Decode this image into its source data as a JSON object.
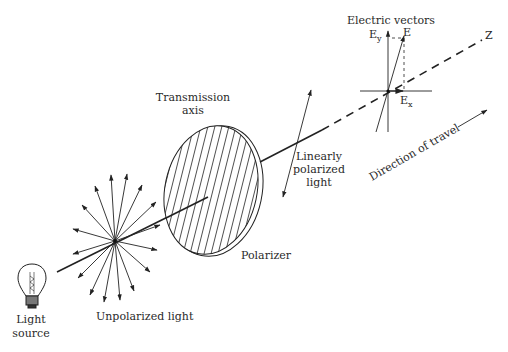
{
  "diagram": {
    "labels": {
      "light_source_line1": "Light",
      "light_source_line2": "source",
      "unpolarized_light": "Unpolarized light",
      "transmission_axis_line1": "Transmission",
      "transmission_axis_line2": "axis",
      "polarizer": "Polarizer",
      "linearly_polarized_line1": "Linearly",
      "linearly_polarized_line2": "polarized",
      "linearly_polarized_line3": "light",
      "direction_of_travel": "Direction of travel",
      "electric_vectors": "Electric vectors",
      "e_y_main": "E",
      "e_y_sub": "y",
      "e": "E",
      "e_x_main": "E",
      "e_x_sub": "x",
      "z_axis": "Z"
    },
    "components": [
      {
        "name": "light source",
        "type": "light-bulb"
      },
      {
        "name": "unpolarized light",
        "type": "starburst",
        "arrow_count": 16
      },
      {
        "name": "polarizer",
        "type": "hatched-disk"
      },
      {
        "name": "linearly polarized light",
        "type": "double-arrow"
      },
      {
        "name": "electric vectors",
        "type": "vector-axes",
        "components": [
          "Ey",
          "E",
          "Ex"
        ]
      },
      {
        "name": "direction of travel",
        "type": "arrow"
      }
    ],
    "colors": {
      "ink": "#222222",
      "background": "#ffffff"
    }
  }
}
